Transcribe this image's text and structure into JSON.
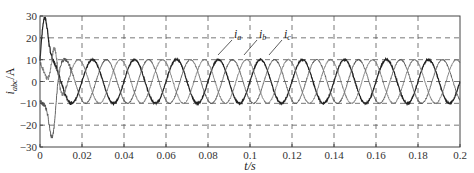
{
  "chart_data": {
    "type": "line",
    "title": "",
    "xlabel": "t/s",
    "ylabel": "i_abc/A",
    "xlim": [
      0,
      0.2
    ],
    "ylim": [
      -30,
      30
    ],
    "x_ticks": [
      "0",
      "0.02",
      "0.04",
      "0.06",
      "0.08",
      "0.1",
      "0.12",
      "0.14",
      "0.16",
      "0.18",
      "0.2"
    ],
    "y_ticks": [
      "30",
      "20",
      "10",
      "0",
      "-10",
      "-20",
      "-30"
    ],
    "grid": "dashed",
    "frequency_hz": 50,
    "steady_state_amplitude": 10,
    "series": [
      {
        "name": "i_a",
        "phase_deg": 0,
        "transient_peak": 29,
        "transient_peak_time": 0.002
      },
      {
        "name": "i_b",
        "phase_deg": -120,
        "transient_peak": -25,
        "transient_peak_time": 0.006
      },
      {
        "name": "i_c",
        "phase_deg": 120,
        "transient_peak": 15,
        "transient_peak_time": 0.007
      }
    ],
    "annotations": [
      "i_a",
      "i_b",
      "i_c"
    ]
  },
  "labels": {
    "ylabel_main": "i",
    "ylabel_sub": "abc",
    "ylabel_unit": "/A",
    "xlabel": "t/s",
    "legend_a": "i",
    "legend_a_sub": "a",
    "legend_b": "i",
    "legend_b_sub": "b",
    "legend_c": "i",
    "legend_c_sub": "c"
  }
}
